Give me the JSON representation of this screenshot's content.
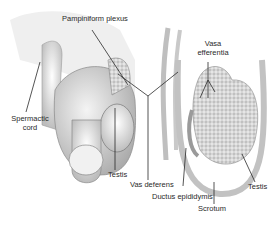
{
  "diagram": {
    "labels": {
      "pampiniform_plexus": "Pampiniform plexus",
      "vasa_efferentia_1": "Vasa",
      "vasa_efferentia_2": "efferentia",
      "spermatic_cord_1": "Spermactic",
      "spermatic_cord_2": "cord",
      "testis_left": "Testis",
      "vas_deferens": "Vas deferens",
      "ductus_epididymis": "Ductus epididymis",
      "scrotum": "Scrotum",
      "testis_right": "Testis"
    },
    "colors": {
      "line": "#2a2a2a",
      "shade": "#cfcfcf",
      "background": "#ffffff"
    }
  }
}
